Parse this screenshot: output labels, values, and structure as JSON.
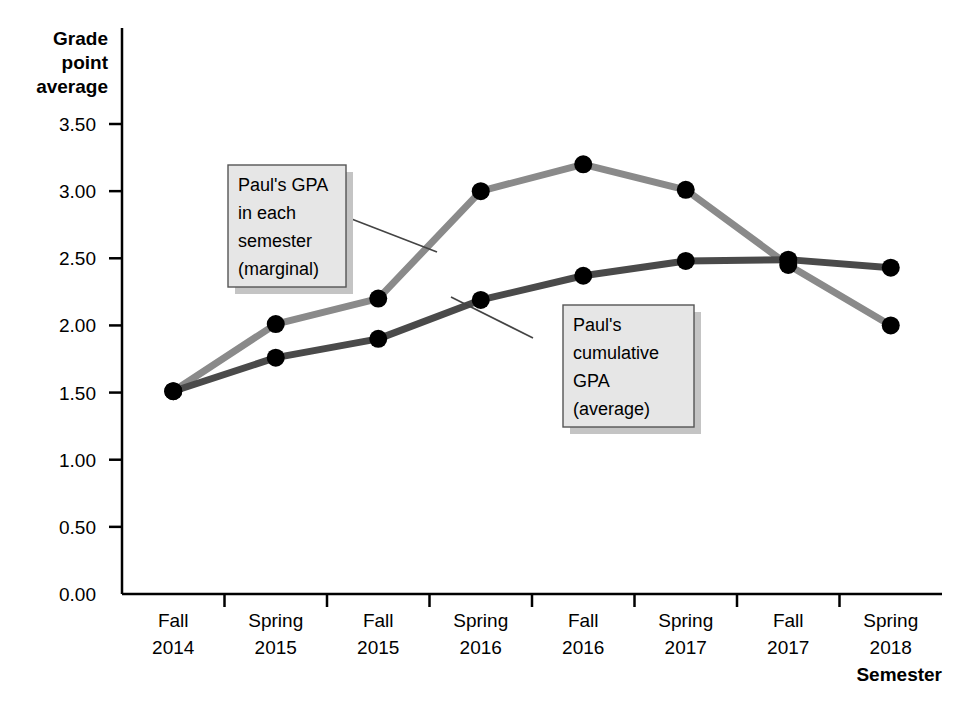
{
  "chart_data": {
    "type": "line",
    "title": "",
    "xlabel": "Semester",
    "ylabel": "Grade point average",
    "categories": [
      "Fall 2014",
      "Spring 2015",
      "Fall 2015",
      "Spring 2016",
      "Fall 2016",
      "Spring 2017",
      "Fall 2017",
      "Spring 2018"
    ],
    "category_lines": [
      [
        "Fall",
        "2014"
      ],
      [
        "Spring",
        "2015"
      ],
      [
        "Fall",
        "2015"
      ],
      [
        "Spring",
        "2016"
      ],
      [
        "Fall",
        "2016"
      ],
      [
        "Spring",
        "2017"
      ],
      [
        "Fall",
        "2017"
      ],
      [
        "Spring",
        "2018"
      ]
    ],
    "ylim": [
      0.0,
      3.5
    ],
    "ytick_labels": [
      "3.50",
      "3.00",
      "2.50",
      "2.00",
      "1.50",
      "1.00",
      "0.50",
      "0.00"
    ],
    "ytick_values": [
      3.5,
      3.0,
      2.5,
      2.0,
      1.5,
      1.0,
      0.5,
      0.0
    ],
    "grid": false,
    "legend": "none",
    "series": [
      {
        "name": "Paul's GPA in each semester (marginal)",
        "color": "#8a8a8a",
        "marker_color": "#000000",
        "values": [
          1.51,
          2.01,
          2.2,
          3.0,
          3.2,
          3.01,
          2.45,
          2.0
        ]
      },
      {
        "name": "Paul's cumulative GPA (average)",
        "color": "#4a4a4a",
        "marker_color": "#000000",
        "values": [
          1.51,
          1.76,
          1.9,
          2.19,
          2.37,
          2.48,
          2.49,
          2.43
        ]
      }
    ],
    "annotations": [
      {
        "id": "marginal-callout",
        "lines": [
          "Paul's GPA",
          "in each",
          "semester",
          "(marginal)"
        ],
        "points_to_category": "Spring 2016"
      },
      {
        "id": "cumulative-callout",
        "lines": [
          "Paul's",
          "cumulative",
          "GPA",
          "(average)"
        ],
        "points_to_category": "Spring 2016"
      }
    ]
  },
  "axis": {
    "y_title_lines": [
      "Grade",
      "point",
      "average"
    ],
    "x_title": "Semester"
  },
  "colors": {
    "marginal_line": "#8a8a8a",
    "cumulative_line": "#4a4a4a",
    "marker": "#000000",
    "axis": "#000000",
    "callout_fill": "#e6e6e6",
    "callout_border": "#555555",
    "callout_shadow": "#c4c4c4"
  }
}
